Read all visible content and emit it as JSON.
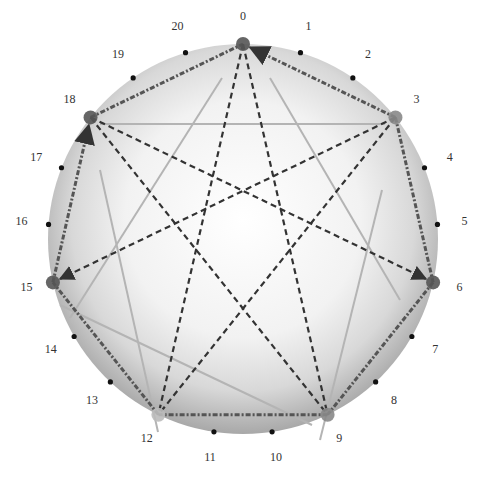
{
  "diagram": {
    "type": "circular-graph",
    "center": [
      243,
      239
    ],
    "radius": 195,
    "label_radius": 222,
    "node_count": 21,
    "labels": [
      "0",
      "1",
      "2",
      "3",
      "4",
      "5",
      "6",
      "7",
      "8",
      "9",
      "10",
      "11",
      "12",
      "13",
      "14",
      "15",
      "16",
      "17",
      "18",
      "19",
      "20"
    ],
    "highlighted_nodes": [
      {
        "index": 0,
        "color": "#555555",
        "size": "large"
      },
      {
        "index": 3,
        "color": "#888888",
        "size": "large"
      },
      {
        "index": 6,
        "color": "#555555",
        "size": "large"
      },
      {
        "index": 9,
        "color": "#888888",
        "size": "large"
      },
      {
        "index": 12,
        "color": "#bbbbbb",
        "size": "large"
      },
      {
        "index": 15,
        "color": "#555555",
        "size": "large"
      },
      {
        "index": 18,
        "color": "#555555",
        "size": "large"
      }
    ],
    "outer_path": {
      "style": "dash-dot",
      "sequence": [
        0,
        3,
        6,
        9,
        12,
        15,
        18
      ],
      "arrows": [
        {
          "from": 3,
          "to": 0
        },
        {
          "from": 15,
          "to": 18
        }
      ]
    },
    "star_path": {
      "style": "dashed",
      "edges": [
        [
          0,
          9
        ],
        [
          0,
          12
        ],
        [
          3,
          12
        ],
        [
          3,
          15
        ],
        [
          18,
          6
        ],
        [
          18,
          9
        ]
      ],
      "arrows": [
        {
          "from": 3,
          "to": 15
        },
        {
          "from": 18,
          "to": 6
        }
      ]
    },
    "inner_star_lines": [
      [
        [
          100,
          124
        ],
        [
          385,
          124
        ]
      ],
      [
        [
          222,
          78
        ],
        [
          70,
          318
        ]
      ],
      [
        [
          270,
          78
        ],
        [
          400,
          300
        ]
      ],
      [
        [
          382,
          190
        ],
        [
          320,
          440
        ]
      ],
      [
        [
          100,
          170
        ],
        [
          158,
          432
        ]
      ],
      [
        [
          60,
          305
        ],
        [
          312,
          425
        ]
      ]
    ],
    "colors": {
      "sphere_edge": "#a8a8a8",
      "sphere_center": "#ffffff",
      "dashed_line": "#333333",
      "dashdot_line": "#555555",
      "inner_line": "#b4b4b4",
      "tick_dot": "#111111"
    }
  }
}
